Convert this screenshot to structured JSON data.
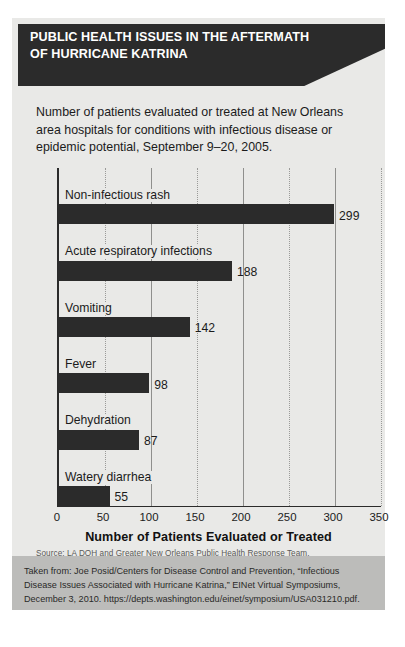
{
  "header": {
    "title": "PUBLIC HEALTH ISSUES IN THE AFTERMATH OF HURRICANE KATRINA",
    "banner_color": "#2b2b2b"
  },
  "subtitle": "Number of patients evaluated or treated at New Orleans area hospitals for conditions with infectious disease or epidemic potential, September 9–20, 2005.",
  "source_note": "Source: LA DOH and Greater New Orleans Public Health Response Team.",
  "citation": "Taken from: Joe Posid/Centers for Disease Control and Prevention, “Infectious Disease Issues Associated with Hurricane Katrina,” EINet Virtual Symposiums, December 3, 2010. https://depts.washington.edu/einet/symposium/USA031210.pdf.",
  "chart_data": {
    "type": "bar",
    "orientation": "horizontal",
    "title": "PUBLIC HEALTH ISSUES IN THE AFTERMATH OF HURRICANE KATRINA",
    "subtitle": "Number of patients evaluated or treated at New Orleans area hospitals for conditions with infectious disease or epidemic potential, September 9–20, 2005.",
    "categories": [
      "Non-infectious rash",
      "Acute respiratory infections",
      "Vomiting",
      "Fever",
      "Dehydration",
      "Watery diarrhea"
    ],
    "values": [
      299,
      188,
      142,
      98,
      87,
      55
    ],
    "xlabel": "Number of Patients Evaluated or Treated",
    "ylabel": "",
    "xlim": [
      0,
      350
    ],
    "xticks": [
      0,
      50,
      100,
      150,
      200,
      250,
      300,
      350
    ],
    "xtick_labels": [
      "0",
      "50",
      "100",
      "150",
      "200",
      "250",
      "300",
      "350"
    ],
    "grid": "vertical-dotted",
    "legend": "none",
    "bar_color": "#2b2b2b",
    "background_color": "#e9e9e7"
  }
}
